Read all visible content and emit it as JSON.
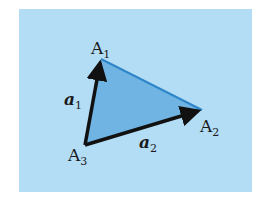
{
  "diagram": {
    "colors": {
      "background": "#b3dcf5",
      "triangle_fill": "#6fb4e3",
      "edge_blue": "#2e86c8",
      "vector_black": "#111111"
    },
    "vertices": {
      "A1": {
        "label": "A",
        "sub": "1"
      },
      "A2": {
        "label": "A",
        "sub": "2"
      },
      "A3": {
        "label": "A",
        "sub": "3"
      }
    },
    "vectors": {
      "a1": {
        "label": "a",
        "sub": "1"
      },
      "a2": {
        "label": "a",
        "sub": "2"
      }
    }
  }
}
